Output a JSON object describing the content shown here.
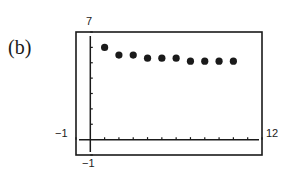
{
  "panel": {
    "label": "(b)"
  },
  "chart_data": {
    "type": "scatter",
    "title": "",
    "xlabel": "",
    "ylabel": "",
    "xlim": [
      -1,
      12
    ],
    "ylim": [
      -1,
      7
    ],
    "window_labels": {
      "xmin": "-1",
      "xmax": "12",
      "ymin": "-1",
      "ymax": "7"
    },
    "grid": false,
    "x_ticks_step": 1,
    "y_ticks_step": 1,
    "series": [
      {
        "name": "points",
        "x": [
          1,
          2,
          3,
          4,
          5,
          6,
          7,
          8,
          9,
          10
        ],
        "y": [
          6.0,
          5.5,
          5.5,
          5.3,
          5.3,
          5.3,
          5.1,
          5.1,
          5.1,
          5.1
        ]
      }
    ],
    "colors": {
      "ink": "#1a1a1a",
      "background": "#ffffff"
    }
  }
}
